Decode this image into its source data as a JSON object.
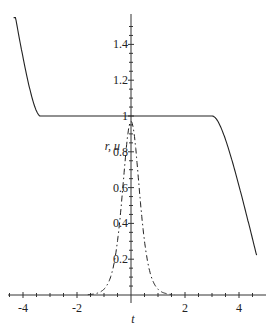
{
  "chart_data": {
    "type": "line",
    "title": "",
    "xlabel": "t",
    "ylabel": "r, u",
    "xlim": [
      -4.5,
      4.8
    ],
    "ylim": [
      0,
      1.55
    ],
    "grid": false,
    "legend": null,
    "x_ticks": [
      -4,
      -2,
      2,
      4
    ],
    "y_ticks": [
      0.2,
      0.4,
      0.6,
      0.8,
      1,
      1.2,
      1.4
    ],
    "series": [
      {
        "name": "r",
        "style": "solid",
        "x": [
          -4.3,
          -4.1,
          -3.9,
          -3.7,
          -3.5,
          -3.2,
          -3.0,
          -2.0,
          0,
          2.0,
          2.8,
          3.0,
          3.2,
          3.4,
          3.6,
          3.8,
          4.0,
          4.2,
          4.4,
          4.6
        ],
        "y": [
          1.5,
          1.3,
          1.1,
          1.03,
          1.01,
          1.0,
          1.0,
          1.0,
          1.0,
          1.0,
          1.0,
          0.99,
          0.96,
          0.88,
          0.76,
          0.62,
          0.48,
          0.35,
          0.22,
          0.12
        ]
      },
      {
        "name": "u",
        "style": "dashdot",
        "x": [
          -1.6,
          -1.2,
          -1.0,
          -0.8,
          -0.6,
          -0.4,
          -0.2,
          0,
          0.2,
          0.4,
          0.6,
          0.8,
          1.0,
          1.2,
          1.6
        ],
        "y": [
          0.0,
          0.03,
          0.07,
          0.15,
          0.3,
          0.52,
          0.8,
          0.97,
          0.8,
          0.52,
          0.3,
          0.15,
          0.07,
          0.03,
          0.0
        ]
      }
    ]
  },
  "axes": {
    "x_label": "t",
    "y_label": "r, u",
    "x_tick_labels": [
      "-4",
      "-2",
      "2",
      "4"
    ],
    "y_tick_labels": [
      "0.2",
      "0.4",
      "0.6",
      "0.8",
      "1",
      "1.2",
      "1.4"
    ]
  }
}
